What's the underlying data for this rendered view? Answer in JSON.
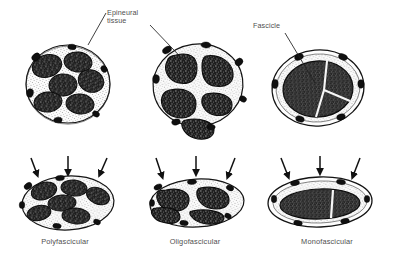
{
  "figure": {
    "title_annotations": [
      {
        "id": "epineural",
        "lines": [
          "Epineural",
          "tissue"
        ],
        "text": "Epineural tissue"
      },
      {
        "id": "fascicle",
        "lines": [
          "Fascicle"
        ],
        "text": "Fascicle"
      }
    ],
    "captions": [
      {
        "id": "polyfascicular",
        "label": "Polyfascicular"
      },
      {
        "id": "oligofascicular",
        "label": "Oligofascicular"
      },
      {
        "id": "monofascicular",
        "label": "Monofascicular"
      }
    ],
    "colors": {
      "background": "#ffffff",
      "ink": "#1a1a1a",
      "fascicle_fill": "#2b2b2b",
      "epineurium_fill": "#f4f4f4",
      "vessel_fill": "#141414",
      "label_text": "#4f4f4f",
      "leader_line": "#1f1f1f"
    },
    "top_row": {
      "description": "Normal nerve cross-sections, round, un-compressed",
      "sections": [
        {
          "id": "top-polyfascicular",
          "fascicle_count": 7,
          "shape": "round"
        },
        {
          "id": "top-oligofascicular",
          "fascicle_count": 5,
          "shape": "round"
        },
        {
          "id": "top-monofascicular",
          "fascicle_count": 1,
          "shape": "round",
          "septa": 2
        }
      ]
    },
    "bottom_row": {
      "description": "Compressed nerve cross-sections, flattened oval, with three compression arrows above each",
      "arrows_per_section": 3,
      "sections": [
        {
          "id": "bottom-polyfascicular",
          "fascicle_count": 6,
          "shape": "flattened-oval"
        },
        {
          "id": "bottom-oligofascicular",
          "fascicle_count": 5,
          "shape": "flattened-oval"
        },
        {
          "id": "bottom-monofascicular",
          "fascicle_count": 1,
          "shape": "flattened-oval",
          "septa": 1
        }
      ]
    }
  }
}
